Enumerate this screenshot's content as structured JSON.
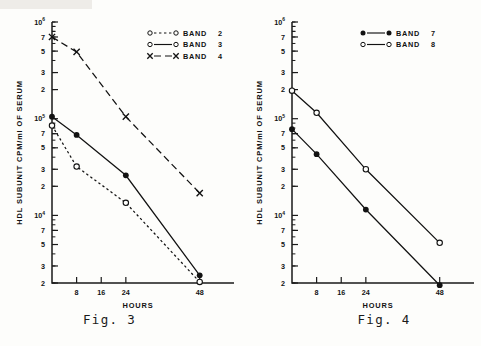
{
  "page": {
    "background": "#fdfdfb",
    "ink": "#121212"
  },
  "figures": [
    {
      "caption": "Fig. 3",
      "ylabel": "HDL SUBUNIT CPM/ml OF SERUM",
      "xlabel": "HOURS",
      "legend_position": "top-right",
      "ytick_labels": [
        {
          "mantissa": "10",
          "exponent": "6"
        },
        {
          "mantissa": "7",
          "exponent": ""
        },
        {
          "mantissa": "5",
          "exponent": ""
        },
        {
          "mantissa": "3",
          "exponent": ""
        },
        {
          "mantissa": "2",
          "exponent": ""
        },
        {
          "mantissa": "10",
          "exponent": "5"
        },
        {
          "mantissa": "7",
          "exponent": ""
        },
        {
          "mantissa": "5",
          "exponent": ""
        },
        {
          "mantissa": "3",
          "exponent": ""
        },
        {
          "mantissa": "2",
          "exponent": ""
        },
        {
          "mantissa": "10",
          "exponent": "4"
        },
        {
          "mantissa": "7",
          "exponent": ""
        },
        {
          "mantissa": "5",
          "exponent": ""
        },
        {
          "mantissa": "3",
          "exponent": ""
        },
        {
          "mantissa": "2",
          "exponent": ""
        }
      ],
      "xtick_labels": [
        "8",
        "16",
        "24",
        "48"
      ],
      "legend": [
        {
          "label": "BAND",
          "number": "2",
          "marker": "open-circle",
          "line": "dotted"
        },
        {
          "label": "BAND",
          "number": "3",
          "marker": "open-circle",
          "line": "solid"
        },
        {
          "label": "BAND",
          "number": "4",
          "marker": "cross",
          "line": "dashed"
        }
      ]
    },
    {
      "caption": "Fig. 4",
      "ylabel": "HDL SUBUNIT CPM/ml OF SERUM",
      "xlabel": "HOURS",
      "legend_position": "top-right",
      "ytick_labels": [
        {
          "mantissa": "10",
          "exponent": "6"
        },
        {
          "mantissa": "7",
          "exponent": ""
        },
        {
          "mantissa": "5",
          "exponent": ""
        },
        {
          "mantissa": "3",
          "exponent": ""
        },
        {
          "mantissa": "2",
          "exponent": ""
        },
        {
          "mantissa": "10",
          "exponent": "5"
        },
        {
          "mantissa": "7",
          "exponent": ""
        },
        {
          "mantissa": "5",
          "exponent": ""
        },
        {
          "mantissa": "3",
          "exponent": ""
        },
        {
          "mantissa": "2",
          "exponent": ""
        },
        {
          "mantissa": "10",
          "exponent": "4"
        },
        {
          "mantissa": "7",
          "exponent": ""
        },
        {
          "mantissa": "5",
          "exponent": ""
        },
        {
          "mantissa": "3",
          "exponent": ""
        },
        {
          "mantissa": "2",
          "exponent": ""
        }
      ],
      "xtick_labels": [
        "8",
        "16",
        "24",
        "48"
      ],
      "legend": [
        {
          "label": "BAND",
          "number": "7",
          "marker": "filled-circle",
          "line": "solid"
        },
        {
          "label": "BAND",
          "number": "8",
          "marker": "open-circle",
          "line": "solid"
        }
      ]
    }
  ],
  "chart_data": [
    {
      "type": "line",
      "title": "Fig. 3",
      "xlabel": "HOURS",
      "ylabel": "HDL SUBUNIT CPM/ml OF SERUM",
      "yscale": "log",
      "ylim": [
        2000,
        1000000
      ],
      "xlim": [
        0,
        52
      ],
      "ytick_values": [
        1000000,
        700000,
        500000,
        300000,
        200000,
        100000,
        70000,
        50000,
        30000,
        20000,
        10000,
        7000,
        5000,
        3000,
        2000
      ],
      "xtick_values": [
        8,
        16,
        24,
        48
      ],
      "grid": false,
      "legend_position": "top-right",
      "series": [
        {
          "name": "BAND 2",
          "marker": "open-circle",
          "linestyle": "dotted",
          "x": [
            0,
            8,
            24,
            48
          ],
          "y": [
            85000,
            32000,
            13500,
            2050
          ]
        },
        {
          "name": "BAND 3",
          "marker": "filled-circle",
          "linestyle": "solid",
          "x": [
            0,
            8,
            24,
            48
          ],
          "y": [
            105000,
            68000,
            26000,
            2400
          ]
        },
        {
          "name": "BAND 4",
          "marker": "cross",
          "linestyle": "dashed",
          "x": [
            0,
            8,
            24,
            48
          ],
          "y": [
            700000,
            490000,
            105000,
            17000
          ]
        }
      ]
    },
    {
      "type": "line",
      "title": "Fig. 4",
      "xlabel": "HOURS",
      "ylabel": "HDL SUBUNIT CPM/ml OF SERUM",
      "yscale": "log",
      "ylim": [
        2000,
        1000000
      ],
      "xlim": [
        0,
        52
      ],
      "ytick_values": [
        1000000,
        700000,
        500000,
        300000,
        200000,
        100000,
        70000,
        50000,
        30000,
        20000,
        10000,
        7000,
        5000,
        3000,
        2000
      ],
      "xtick_values": [
        8,
        16,
        24,
        48
      ],
      "grid": false,
      "legend_position": "top-right",
      "series": [
        {
          "name": "BAND 7",
          "marker": "filled-circle",
          "linestyle": "solid",
          "x": [
            0,
            8,
            24,
            48
          ],
          "y": [
            78000,
            43000,
            11500,
            1900
          ]
        },
        {
          "name": "BAND 8",
          "marker": "open-circle",
          "linestyle": "solid",
          "x": [
            0,
            8,
            24,
            48
          ],
          "y": [
            195000,
            115000,
            30000,
            5200
          ]
        }
      ]
    }
  ]
}
